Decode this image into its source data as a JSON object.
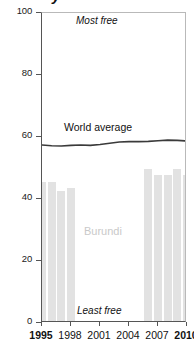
{
  "title_fragment": "y",
  "chart_data": {
    "type": "bar",
    "title": "",
    "xlabel": "",
    "ylabel": "",
    "ylim": [
      0,
      100
    ],
    "xlim": [
      1995,
      2010
    ],
    "grid": false,
    "axis_frame": true,
    "y_ticks": [
      0,
      20,
      40,
      60,
      80,
      100
    ],
    "x_ticks": [
      1995,
      1998,
      2001,
      2004,
      2007,
      2010
    ],
    "x_ticks_bold": [
      1995,
      2010
    ],
    "annotations": [
      {
        "text": "Most free",
        "x": 2002,
        "y": 97,
        "style": "italic"
      },
      {
        "text": "Least free",
        "x": 2002,
        "y": 4,
        "style": "italic"
      }
    ],
    "series": [
      {
        "name": "Burundi",
        "type": "bar",
        "color": "#e2e2e2",
        "label_color": "#c9c9c9",
        "x": [
          1995,
          1996,
          1997,
          1998,
          2006,
          2007,
          2008,
          2009,
          2010
        ],
        "values": [
          45,
          45,
          42,
          43,
          49,
          47,
          47,
          49,
          47
        ]
      },
      {
        "name": "World average",
        "type": "line",
        "color": "#3a3a3a",
        "x": [
          1995,
          1996,
          1997,
          1998,
          1999,
          2000,
          2001,
          2002,
          2003,
          2004,
          2005,
          2006,
          2007,
          2008,
          2009,
          2010
        ],
        "values": [
          57.4,
          57.2,
          57.1,
          57.3,
          57.4,
          57.3,
          57.6,
          58.0,
          58.4,
          58.5,
          58.5,
          58.6,
          58.8,
          59.0,
          58.9,
          58.7
        ]
      }
    ]
  }
}
